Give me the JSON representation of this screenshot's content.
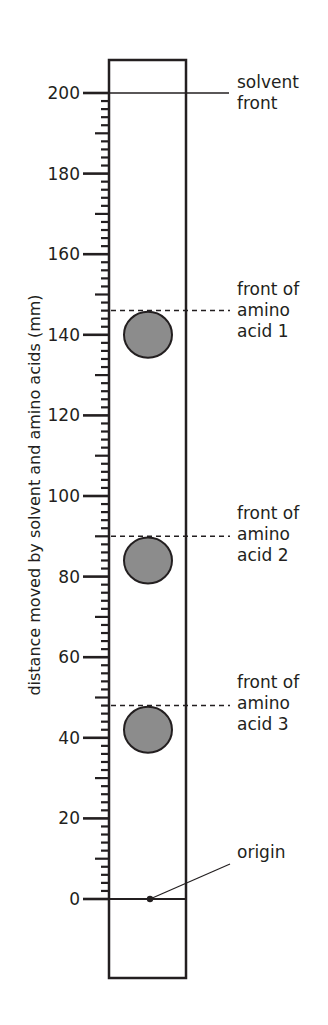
{
  "figure": {
    "type": "paper chromatography diagram",
    "y_axis_label": "distance moved by solvent and amino acids (mm)",
    "scale": {
      "min": 0,
      "max": 200,
      "major_step": 20,
      "medium_step": 10,
      "minor_step": 2
    },
    "tick_labels": [
      "200",
      "180",
      "160",
      "140",
      "120",
      "100",
      "80",
      "60",
      "40",
      "20",
      "0"
    ],
    "annotations": {
      "solvent_front": "solvent\nfront",
      "acid1": "front of\namino\nacid 1",
      "acid2": "front of\namino\nacid 2",
      "acid3": "front of\namino\nacid 3",
      "origin": "origin"
    },
    "colors": {
      "ink": "#231f20",
      "spot_fill": "#8c8c8c",
      "paper": "#ffffff"
    }
  },
  "chart_data": {
    "type": "table",
    "ylabel": "distance moved by solvent and amino acids (mm)",
    "ylim": [
      0,
      200
    ],
    "rows": [
      {
        "name": "solvent front",
        "distance_mm": 200
      },
      {
        "name": "front of amino acid 1",
        "distance_mm": 146,
        "spot_center_mm": 140
      },
      {
        "name": "front of amino acid 2",
        "distance_mm": 90,
        "spot_center_mm": 84
      },
      {
        "name": "front of amino acid 3",
        "distance_mm": 48,
        "spot_center_mm": 42
      },
      {
        "name": "origin",
        "distance_mm": 0
      }
    ]
  }
}
